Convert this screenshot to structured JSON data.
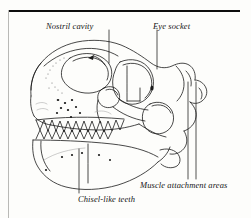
{
  "figure": {
    "background_color": "#fdfdfb",
    "ink_color": "#1a1a1a",
    "rule_color": "#0d0d0d",
    "margin_rule_color": "#b9b9b6"
  },
  "labels": {
    "nostril": "Nostril cavity",
    "eye": "Eye socket",
    "muscle": "Muscle attachment areas",
    "teeth": "Chisel-like teeth"
  },
  "leaders": {
    "nostril": {
      "x": 109,
      "y_top": 30,
      "y_bottom": 63
    },
    "eye": {
      "x": 157,
      "y_top": 30,
      "y_bottom": 69
    },
    "muscle_a": {
      "x": 188,
      "y_top": 82,
      "y_bottom": 179
    },
    "muscle_b": {
      "x": 196,
      "y_top": 82,
      "y_bottom": 179
    },
    "teeth": {
      "x": 79,
      "y_top": 149,
      "y_bottom": 193
    }
  }
}
